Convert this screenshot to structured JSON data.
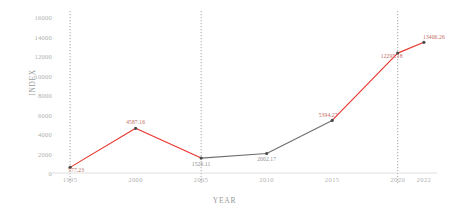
{
  "chart_data": {
    "type": "line",
    "title": "",
    "xlabel": "YEAR",
    "ylabel": "INDEX",
    "x": [
      1995,
      2000,
      2005,
      2010,
      2015,
      2020,
      2022
    ],
    "values": [
      577.23,
      4587.16,
      1526.11,
      2002.17,
      5394.27,
      12295.18,
      13406.26
    ],
    "point_labels": [
      "577.23",
      "4587.16",
      "1526.11",
      "2002.17",
      "5394.27",
      "12295.18",
      "13406.26"
    ],
    "xtick_labels": [
      "1995",
      "2000",
      "2005",
      "2010",
      "2015",
      "2020",
      "2022"
    ],
    "ytick_labels": [
      "0",
      "2000",
      "4000",
      "6000",
      "8000",
      "10000",
      "12000",
      "14000",
      "16000"
    ],
    "ytick_values": [
      0,
      2000,
      4000,
      6000,
      8000,
      10000,
      12000,
      14000,
      16000
    ],
    "ylim": [
      0,
      16000
    ],
    "xlim": [
      1994,
      2023
    ],
    "grid": "vertical-dotted",
    "gridlines_x": [
      1995,
      2005,
      2020
    ],
    "legend": "none",
    "series_colors": {
      "rising": "#e8332a",
      "falling": "#6f6f6f"
    },
    "segment_colors": [
      "#e8332a",
      "#e8332a",
      "#6f6f6f",
      "#6f6f6f",
      "#e8332a",
      "#e8332a"
    ],
    "marker_color": "#4a4a4a",
    "axis_color": "#d8d8d8"
  }
}
